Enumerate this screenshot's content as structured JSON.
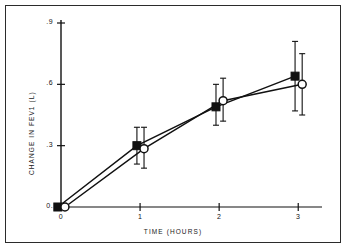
{
  "chart_data": {
    "type": "line",
    "title": "",
    "xlabel": "TIME (HOURS)",
    "ylabel": "CHANGE IN FEV1 (L)",
    "xlim": [
      0,
      3.25
    ],
    "ylim": [
      0,
      0.9
    ],
    "grid": false,
    "legend": "none",
    "xticks": [
      0,
      1,
      2,
      3
    ],
    "xticklabels": [
      "0",
      "1",
      "2",
      "3"
    ],
    "yticks": [
      0,
      0.3,
      0.6,
      0.9
    ],
    "yticklabels": [
      "0.",
      ".3",
      ".6",
      ".9"
    ],
    "x": [
      0,
      1,
      2,
      3
    ],
    "series": [
      {
        "name": "filled-square-series",
        "marker": "filled-square",
        "color": "#111111",
        "x_offset": -0.04,
        "values": [
          0.0,
          0.3,
          0.49,
          0.64
        ],
        "error_low": [
          0.0,
          0.21,
          0.4,
          0.47
        ],
        "error_high": [
          0.0,
          0.39,
          0.6,
          0.81
        ]
      },
      {
        "name": "open-circle-series",
        "marker": "open-circle",
        "color": "#111111",
        "x_offset": 0.05,
        "values": [
          0.0,
          0.285,
          0.52,
          0.6
        ],
        "error_low": [
          0.0,
          0.19,
          0.42,
          0.45
        ],
        "error_high": [
          0.0,
          0.39,
          0.63,
          0.75
        ]
      }
    ]
  },
  "axes": {
    "ylabel": "CHANGE IN FEV1 (L)",
    "xlabel": "TIME (HOURS)",
    "yticklabels": [
      "0.",
      ".3",
      ".6",
      ".9"
    ],
    "xticklabels": [
      "0",
      "1",
      "2",
      "3"
    ]
  },
  "colors": {
    "ink": "#111111",
    "frame": "#2b2b2b",
    "background": "#ffffff"
  }
}
